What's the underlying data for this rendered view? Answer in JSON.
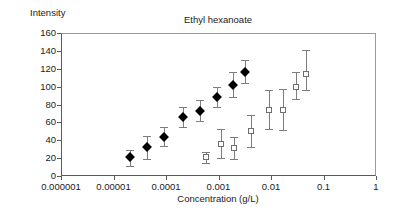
{
  "chart_data": {
    "type": "scatter",
    "title": "Ethyl hexanoate",
    "xlabel": "Concentration (g/L)",
    "ylabel": "Intensity",
    "xscale": "log",
    "yscale": "linear",
    "xlim": [
      1e-06,
      1
    ],
    "ylim": [
      0,
      160
    ],
    "ytick_labels": [
      "0",
      "20",
      "40",
      "60",
      "80",
      "100",
      "120",
      "140",
      "160"
    ],
    "ytick_values": [
      0,
      20,
      40,
      60,
      80,
      100,
      120,
      140,
      160
    ],
    "xtick_labels": [
      "0.000001",
      "0.00001",
      "0.0001",
      "0.001",
      "0.01",
      "0.1",
      "1"
    ],
    "xtick_values": [
      1e-06,
      1e-05,
      0.0001,
      0.001,
      0.01,
      0.1,
      1
    ],
    "grid": false,
    "legend": false,
    "series": [
      {
        "name": "filled-diamond-series",
        "marker": "filled-diamond",
        "color": "#000000",
        "points": [
          {
            "x": 2.1e-05,
            "y": 21,
            "yerr_low": 11,
            "yerr_high": 29
          },
          {
            "x": 4.4e-05,
            "y": 32,
            "yerr_low": 19,
            "yerr_high": 45
          },
          {
            "x": 9.2e-05,
            "y": 44,
            "yerr_low": 34,
            "yerr_high": 55
          },
          {
            "x": 0.00021,
            "y": 66,
            "yerr_low": 55,
            "yerr_high": 77
          },
          {
            "x": 0.00044,
            "y": 73,
            "yerr_low": 62,
            "yerr_high": 85
          },
          {
            "x": 0.00092,
            "y": 88,
            "yerr_low": 77,
            "yerr_high": 100
          },
          {
            "x": 0.0019,
            "y": 102,
            "yerr_low": 88,
            "yerr_high": 116
          },
          {
            "x": 0.0032,
            "y": 116,
            "yerr_low": 104,
            "yerr_high": 130
          }
        ]
      },
      {
        "name": "open-square-series",
        "marker": "open-square",
        "color": "#6f6f6f",
        "points": [
          {
            "x": 0.00058,
            "y": 21,
            "yerr_low": 15,
            "yerr_high": 27
          },
          {
            "x": 0.0011,
            "y": 36,
            "yerr_low": 20,
            "yerr_high": 53
          },
          {
            "x": 0.002,
            "y": 31,
            "yerr_low": 19,
            "yerr_high": 44
          },
          {
            "x": 0.0042,
            "y": 50,
            "yerr_low": 33,
            "yerr_high": 68
          },
          {
            "x": 0.0092,
            "y": 74,
            "yerr_low": 53,
            "yerr_high": 96
          },
          {
            "x": 0.017,
            "y": 74,
            "yerr_low": 51,
            "yerr_high": 97
          },
          {
            "x": 0.03,
            "y": 100,
            "yerr_low": 86,
            "yerr_high": 116
          },
          {
            "x": 0.046,
            "y": 114,
            "yerr_low": 96,
            "yerr_high": 141
          }
        ]
      }
    ]
  }
}
